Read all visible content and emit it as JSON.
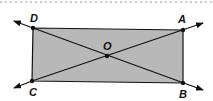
{
  "diagram": {
    "type": "rectangle-with-diagonals",
    "colors": {
      "fill": "#b8b8b8",
      "stroke": "#111111",
      "dotted_rule": "#9a9a9a"
    },
    "points": {
      "D": {
        "label": "D",
        "x": 33,
        "y": 28
      },
      "A": {
        "label": "A",
        "x": 183,
        "y": 30
      },
      "B": {
        "label": "B",
        "x": 183,
        "y": 83
      },
      "C": {
        "label": "C",
        "x": 32,
        "y": 81
      },
      "O": {
        "label": "O",
        "x": 107,
        "y": 56
      }
    },
    "lines": [
      {
        "name": "line-DB",
        "through": [
          "D",
          "B"
        ],
        "description": "line through D and B, arrows both ends"
      },
      {
        "name": "line-CA",
        "through": [
          "C",
          "A"
        ],
        "description": "line through C and A, arrows both ends"
      }
    ]
  }
}
